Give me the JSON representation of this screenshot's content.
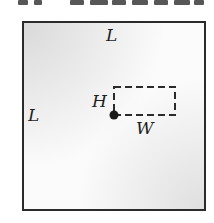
{
  "diagram": {
    "labels": {
      "top_side": "L",
      "left_side": "L",
      "rect_height": "H",
      "rect_width": "W"
    },
    "colors": {
      "border": "#2b2b2b",
      "dashed_rect": "#2b2b2b",
      "point": "#1a1a1a"
    }
  }
}
